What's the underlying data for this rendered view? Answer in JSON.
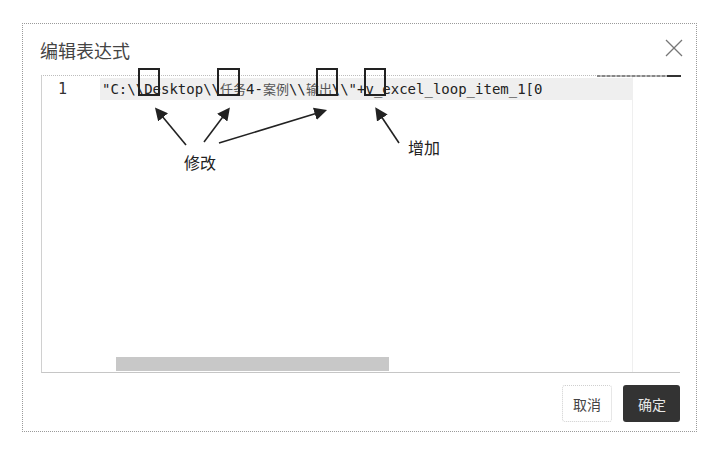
{
  "dialog": {
    "title": "编辑表达式",
    "close_icon": "close-icon"
  },
  "editor": {
    "lines": [
      {
        "number": "1",
        "segments": [
          {
            "text": "\"C:",
            "cjk": false
          },
          {
            "text": "\\\\",
            "cjk": false
          },
          {
            "text": "Desktop",
            "cjk": false
          },
          {
            "text": "\\\\",
            "cjk": false
          },
          {
            "text": "任务",
            "cjk": true
          },
          {
            "text": "4-",
            "cjk": false
          },
          {
            "text": "案例",
            "cjk": true
          },
          {
            "text": "\\\\",
            "cjk": false
          },
          {
            "text": "输出",
            "cjk": true
          },
          {
            "text": "\\\\",
            "cjk": false
          },
          {
            "text": "\"+v_excel_loop_item_1[0",
            "cjk": false
          }
        ]
      }
    ],
    "horizontal_scroll_position": 0.0
  },
  "annotations": {
    "modify_label": "修改",
    "add_label": "增加"
  },
  "footer": {
    "cancel_label": "取消",
    "ok_label": "确定"
  },
  "colors": {
    "primary_button": "#333333",
    "line_highlight": "#efefef"
  }
}
